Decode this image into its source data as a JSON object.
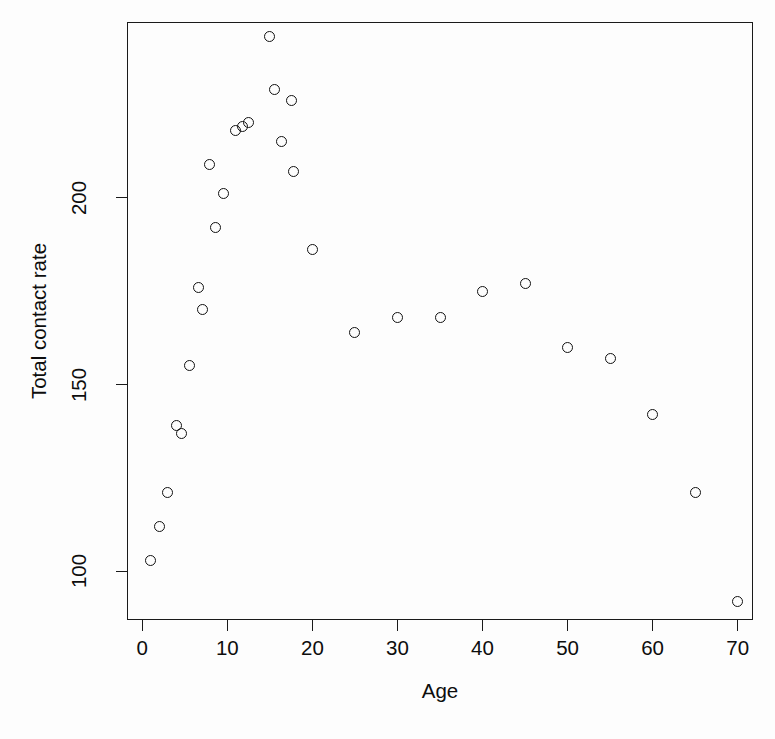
{
  "chart_data": {
    "type": "scatter",
    "title": "",
    "xlabel": "Age",
    "ylabel": "Total contact rate",
    "xlim": [
      -1.8,
      71.8
    ],
    "ylim": [
      87,
      247
    ],
    "xticks": [
      0,
      10,
      20,
      30,
      40,
      50,
      60,
      70
    ],
    "yticks": [
      100,
      150,
      200
    ],
    "grid": false,
    "legend": null,
    "marker": "open-circle",
    "marker_color": "#111111",
    "x": [
      1,
      2,
      3,
      4,
      5,
      6,
      7,
      8,
      9,
      10,
      11,
      12,
      13,
      14,
      15,
      16,
      17,
      18,
      20,
      25,
      30,
      35,
      40,
      45,
      50,
      55,
      60,
      65,
      70
    ],
    "y": [
      103,
      112,
      121,
      139,
      137,
      155,
      176,
      170,
      209,
      192,
      201,
      218,
      219,
      220,
      243,
      229,
      215,
      226,
      207,
      186,
      164,
      168,
      168,
      175,
      177,
      160,
      157,
      142,
      121,
      92
    ],
    "points": [
      {
        "x": 1,
        "y": 103
      },
      {
        "x": 2,
        "y": 112
      },
      {
        "x": 3,
        "y": 121
      },
      {
        "x": 4,
        "y": 139
      },
      {
        "x": 4.6,
        "y": 137
      },
      {
        "x": 5.5,
        "y": 155
      },
      {
        "x": 6.6,
        "y": 176
      },
      {
        "x": 7.1,
        "y": 170
      },
      {
        "x": 7.9,
        "y": 209
      },
      {
        "x": 8.6,
        "y": 192
      },
      {
        "x": 9.6,
        "y": 201
      },
      {
        "x": 11.0,
        "y": 218
      },
      {
        "x": 11.8,
        "y": 219
      },
      {
        "x": 12.5,
        "y": 220
      },
      {
        "x": 15.0,
        "y": 243
      },
      {
        "x": 15.6,
        "y": 229
      },
      {
        "x": 16.4,
        "y": 215
      },
      {
        "x": 17.5,
        "y": 226
      },
      {
        "x": 17.8,
        "y": 207
      },
      {
        "x": 20.0,
        "y": 186
      },
      {
        "x": 25.0,
        "y": 164
      },
      {
        "x": 30.0,
        "y": 168
      },
      {
        "x": 35.0,
        "y": 168
      },
      {
        "x": 40.0,
        "y": 175
      },
      {
        "x": 45.0,
        "y": 177
      },
      {
        "x": 50.0,
        "y": 160
      },
      {
        "x": 55.0,
        "y": 157
      },
      {
        "x": 60.0,
        "y": 142
      },
      {
        "x": 65.0,
        "y": 121
      },
      {
        "x": 70.0,
        "y": 92
      }
    ]
  }
}
